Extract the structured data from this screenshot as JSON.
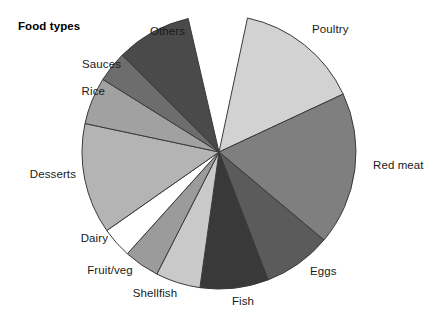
{
  "chart": {
    "title": "Food types",
    "title_position": {
      "x": 18,
      "y": 26
    }
  },
  "chart_data": {
    "type": "pie",
    "title": "Food types",
    "xlabel": "",
    "ylabel": "",
    "grid": false,
    "legend_position": "outside-labels",
    "center": {
      "x": 219,
      "y": 152
    },
    "radius": 137,
    "start_angle_deg": 78,
    "direction": "clockwise",
    "categories": [
      "Poultry",
      "Red meat",
      "Eggs",
      "Fish",
      "Shellfish",
      "Fruit/veg",
      "Dairy",
      "Desserts",
      "Rice",
      "Sauces",
      "Others"
    ],
    "values": [
      15.0,
      18.0,
      8.0,
      8.0,
      5.5,
      4.0,
      3.5,
      9.5,
      5.5,
      3.5,
      8.5
    ],
    "colors": [
      "#d2d2d2",
      "#7f7f7f",
      "#5b5b5b",
      "#393939",
      "#c9c9c9",
      "#9b9b9b",
      "#ffffff",
      "#b4b4b4",
      "#a1a1a1",
      "#6d6d6d",
      "#4a4a4a"
    ],
    "slice_angles_deg": [
      {
        "name": "Poultry",
        "start": 78,
        "end": 25
      },
      {
        "name": "Red meat",
        "start": 25,
        "end": -40
      },
      {
        "name": "Eggs",
        "start": -40,
        "end": -69
      },
      {
        "name": "Fish",
        "start": -69,
        "end": -98
      },
      {
        "name": "Shellfish",
        "start": -98,
        "end": -117
      },
      {
        "name": "Fruit/veg",
        "start": -117,
        "end": -132
      },
      {
        "name": "Dairy",
        "start": -132,
        "end": -145
      },
      {
        "name": "Desserts",
        "start": -145,
        "end": -192
      },
      {
        "name": "Rice",
        "start": -192,
        "end": -212
      },
      {
        "name": "Sauces",
        "start": -212,
        "end": -225
      },
      {
        "name": "Others",
        "start": -225,
        "end": -257
      }
    ],
    "stroke_color": "#3a3a3a",
    "stroke_width": 1
  },
  "labels": [
    {
      "key": "poultry",
      "text": "Poultry",
      "x": 312,
      "y": 29,
      "align": "left"
    },
    {
      "key": "red-meat",
      "text": "Red meat",
      "x": 373,
      "y": 165,
      "align": "left"
    },
    {
      "key": "eggs",
      "text": "Eggs",
      "x": 310,
      "y": 271,
      "align": "left"
    },
    {
      "key": "fish",
      "text": "Fish",
      "x": 243,
      "y": 301,
      "align": "mid"
    },
    {
      "key": "shellfish",
      "text": "Shellfish",
      "x": 155,
      "y": 293,
      "align": "mid"
    },
    {
      "key": "fruit-veg",
      "text": "Fruit/veg",
      "x": 110,
      "y": 270,
      "align": "mid"
    },
    {
      "key": "dairy",
      "text": "Dairy",
      "x": 108,
      "y": 238,
      "align": "right"
    },
    {
      "key": "desserts",
      "text": "Desserts",
      "x": 76,
      "y": 174,
      "align": "right"
    },
    {
      "key": "rice",
      "text": "Rice",
      "x": 105,
      "y": 91,
      "align": "right"
    },
    {
      "key": "sauces",
      "text": "Sauces",
      "x": 121,
      "y": 64,
      "align": "right"
    },
    {
      "key": "others",
      "text": "Others",
      "x": 150,
      "y": 31,
      "align": "left"
    }
  ]
}
